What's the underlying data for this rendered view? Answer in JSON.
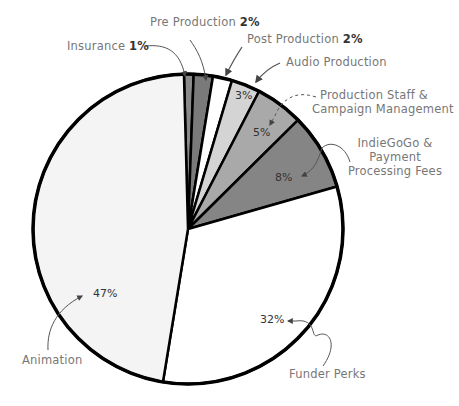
{
  "chart_data": {
    "type": "pie",
    "title": "",
    "start_angle_deg": -1.5,
    "direction": "clockwise",
    "slices": [
      {
        "label": "Insurance",
        "value": 1,
        "pct_label": "1%",
        "color": "#8a8a8a"
      },
      {
        "label": "Pre Production",
        "value": 2,
        "pct_label": "2%",
        "color": "#7a7a7a"
      },
      {
        "label": "Post Production",
        "value": 2,
        "pct_label": "2%",
        "color": "#ffffff"
      },
      {
        "label": "Audio Production",
        "value": 3,
        "pct_label": "3%",
        "color": "#d4d4d4"
      },
      {
        "label": "Production Staff & Campaign Management",
        "value": 5,
        "pct_label": "5%",
        "color": "#a9a9a9"
      },
      {
        "label": "IndieGoGo & Payment Processing Fees",
        "value": 8,
        "pct_label": "8%",
        "color": "#858585"
      },
      {
        "label": "Funder Perks",
        "value": 32,
        "pct_label": "32%",
        "color": "#ffffff"
      },
      {
        "label": "Animation",
        "value": 47,
        "pct_label": "47%",
        "color": "#f4f4f4"
      }
    ],
    "legend": "none (callout labels with arrows)"
  },
  "labels": {
    "insurance": "Insurance",
    "insurance_pct": "1%",
    "pre_production": "Pre Production",
    "pre_production_pct": "2%",
    "post_production": "Post Production",
    "post_production_pct": "2%",
    "audio_production": "Audio Production",
    "audio_pct": "3%",
    "staff_line1": "Production Staff &",
    "staff_line2": "Campaign Management",
    "staff_pct": "5%",
    "indiegogo_line1": "IndieGoGo &",
    "indiegogo_line2": "Payment",
    "indiegogo_line3": "Processing Fees",
    "indiegogo_pct": "8%",
    "funder_perks": "Funder Perks",
    "funder_pct": "32%",
    "animation": "Animation",
    "animation_pct": "47%"
  }
}
